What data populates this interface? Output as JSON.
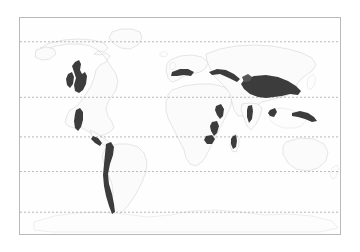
{
  "figure": {
    "type": "world-map",
    "title": "",
    "projection": "equirectangular",
    "background_color": "#ffffff",
    "frame": {
      "border_color": "#b9b9b9",
      "fill_color": "#fefefe",
      "x": 19,
      "y": 17,
      "width": 322,
      "height": 218
    }
  },
  "map": {
    "land_fill": "#fbfbfb",
    "land_stroke": "#d2d2d2",
    "highlight_color": "#3c3c3c",
    "graticule": {
      "style": "dashed",
      "color": "#9a9a9a",
      "latitude_lines": [
        {
          "label": "",
          "y": 41
        },
        {
          "label": "",
          "y": 97
        },
        {
          "label": "",
          "y": 137
        },
        {
          "label": "",
          "y": 172
        },
        {
          "label": "",
          "y": 213
        }
      ]
    },
    "highlight_regions": [
      {
        "name": "rocky-mountains-cordillera",
        "continent": "North America"
      },
      {
        "name": "sierra-madre-occidental",
        "continent": "North America"
      },
      {
        "name": "central-america-ranges",
        "continent": "North America"
      },
      {
        "name": "andes-mountains",
        "continent": "South America"
      },
      {
        "name": "alps-pyrenees-belt",
        "continent": "Europe"
      },
      {
        "name": "caucasus-zagros-belt",
        "continent": "Asia"
      },
      {
        "name": "himalaya-tibetan-plateau",
        "continent": "Asia"
      },
      {
        "name": "western-ghats",
        "continent": "Asia"
      },
      {
        "name": "ethiopian-highlands",
        "continent": "Africa"
      },
      {
        "name": "east-african-rift",
        "continent": "Africa"
      },
      {
        "name": "madagascar-highlands",
        "continent": "Africa"
      },
      {
        "name": "new-guinea-highlands",
        "continent": "Oceania"
      },
      {
        "name": "sumatra-java-arc",
        "continent": "Oceania"
      }
    ],
    "continent_outlines": [
      {
        "name": "north-america"
      },
      {
        "name": "south-america"
      },
      {
        "name": "europe"
      },
      {
        "name": "africa"
      },
      {
        "name": "asia"
      },
      {
        "name": "australia"
      },
      {
        "name": "antarctica"
      },
      {
        "name": "greenland"
      }
    ]
  }
}
